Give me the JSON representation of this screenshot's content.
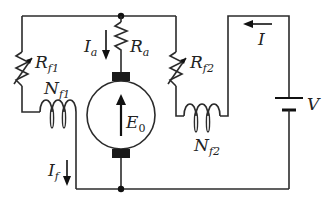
{
  "diagram": {
    "type": "circuit",
    "colors": {
      "line": "#2b2b2b",
      "background": "#ffffff",
      "brush": "#1a1a1a"
    },
    "labels": {
      "Ia": {
        "main": "I",
        "sub": "a"
      },
      "Ra": {
        "main": "R",
        "sub": "a"
      },
      "Rf1": {
        "main": "R",
        "sub": "f1"
      },
      "Rf2": {
        "main": "R",
        "sub": "f2"
      },
      "Nf1": {
        "main": "N",
        "sub": "f1"
      },
      "Nf2": {
        "main": "N",
        "sub": "f2"
      },
      "E0": {
        "main": "E",
        "sub": "0"
      },
      "If": {
        "main": "I",
        "sub": "f"
      },
      "I": {
        "main": "I"
      },
      "V": {
        "main": "V"
      }
    },
    "components": [
      {
        "id": "Ra",
        "kind": "resistor",
        "label": "Ra"
      },
      {
        "id": "Rf1",
        "kind": "variable-resistor",
        "label": "Rf1"
      },
      {
        "id": "Rf2",
        "kind": "variable-resistor",
        "label": "Rf2"
      },
      {
        "id": "Nf1",
        "kind": "inductor-coil",
        "label": "Nf1"
      },
      {
        "id": "Nf2",
        "kind": "inductor-coil",
        "label": "Nf2"
      },
      {
        "id": "armature",
        "kind": "dc-machine",
        "label": "E0"
      },
      {
        "id": "V",
        "kind": "battery",
        "label": "V"
      }
    ],
    "currents": [
      {
        "label": "Ia",
        "direction": "down"
      },
      {
        "label": "If",
        "direction": "down"
      },
      {
        "label": "I",
        "direction": "left"
      }
    ]
  }
}
